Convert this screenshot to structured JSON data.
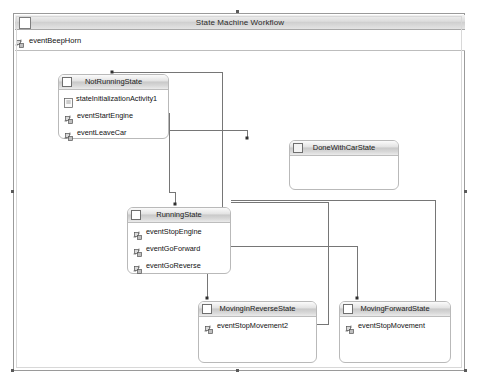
{
  "window": {
    "title": "State Machine Workflow",
    "titlebar_icon": "workflow-icon"
  },
  "root_event": {
    "icon": "event-driven-activity-icon",
    "label": "eventBeepHorn"
  },
  "states": [
    {
      "id": "not-running-state",
      "name": "NotRunningState",
      "icon": "state-activity-icon",
      "x": 41,
      "y": 22,
      "w": 111,
      "h": 65,
      "activities": [
        {
          "icon": "state-initialization-icon",
          "label": "stateInitializationActivity1"
        },
        {
          "icon": "event-driven-activity-icon",
          "label": "eventStartEngine"
        },
        {
          "icon": "event-driven-activity-icon",
          "label": "eventLeaveCar"
        }
      ]
    },
    {
      "id": "done-with-car-state",
      "name": "DoneWithCarState",
      "icon": "state-activity-icon",
      "x": 272,
      "y": 88,
      "w": 110,
      "h": 50,
      "activities": []
    },
    {
      "id": "running-state",
      "name": "RunningState",
      "icon": "state-activity-icon",
      "x": 110,
      "y": 155,
      "w": 104,
      "h": 67,
      "activities": [
        {
          "icon": "event-driven-activity-icon",
          "label": "eventStopEngine"
        },
        {
          "icon": "event-driven-activity-icon",
          "label": "eventGoForward"
        },
        {
          "icon": "event-driven-activity-icon",
          "label": "eventGoReverse"
        }
      ]
    },
    {
      "id": "moving-in-reverse-state",
      "name": "MovingInReverseState",
      "icon": "state-activity-icon",
      "x": 181,
      "y": 249,
      "w": 119,
      "h": 62,
      "activities": [
        {
          "icon": "event-driven-activity-icon",
          "label": "eventStopMovement2"
        }
      ]
    },
    {
      "id": "moving-forward-state",
      "name": "MovingForwardState",
      "icon": "state-activity-icon",
      "x": 322,
      "y": 249,
      "w": 112,
      "h": 62,
      "activities": [
        {
          "icon": "event-driven-activity-icon",
          "label": "eventStopMovement"
        }
      ]
    }
  ],
  "colors": {
    "frame_border": "#9a9a9a",
    "state_border": "#b9b9b9",
    "connector": "#767676",
    "header_gradient_mid": "#c9c9c9",
    "canvas": "#ffffff"
  }
}
